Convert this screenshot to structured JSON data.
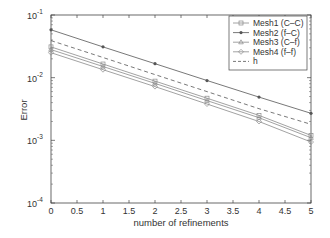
{
  "chart_data": {
    "type": "line",
    "title": "",
    "xlabel": "number of refinements",
    "ylabel": "Error",
    "xscale": "linear",
    "yscale": "log",
    "xlim": [
      0,
      5
    ],
    "ylim": [
      0.0001,
      0.1
    ],
    "grid": false,
    "legend_position": "upper right",
    "x": [
      0,
      1,
      2,
      3,
      4,
      5
    ],
    "x_tick_labels": [
      "0",
      "0.5",
      "1",
      "1.5",
      "2",
      "2.5",
      "3",
      "3.5",
      "4",
      "4.5",
      "5"
    ],
    "x_ticks": [
      0,
      0.5,
      1,
      1.5,
      2,
      2.5,
      3,
      3.5,
      4,
      4.5,
      5
    ],
    "y_ticks": [
      0.1,
      0.01,
      0.001,
      0.0001
    ],
    "y_tick_labels": [
      {
        "base": "10",
        "exp": "-1"
      },
      {
        "base": "10",
        "exp": "-2"
      },
      {
        "base": "10",
        "exp": "-3"
      },
      {
        "base": "10",
        "exp": "-4"
      }
    ],
    "series": [
      {
        "name": "Mesh1 (C–C)",
        "marker": "square",
        "dash": "solid",
        "color": "#8a8a8a",
        "values": [
          0.031,
          0.0165,
          0.0088,
          0.0047,
          0.0025,
          0.0012
        ]
      },
      {
        "name": "Mesh2 (f–C)",
        "marker": "dot",
        "dash": "solid",
        "color": "#555555",
        "values": [
          0.058,
          0.031,
          0.0167,
          0.009,
          0.0049,
          0.0027
        ]
      },
      {
        "name": "Mesh3 (C–f)",
        "marker": "triangle",
        "dash": "solid",
        "color": "#8a8a8a",
        "values": [
          0.028,
          0.0151,
          0.0081,
          0.0043,
          0.0023,
          0.0011
        ]
      },
      {
        "name": "Mesh4 (f–f)",
        "marker": "diamond",
        "dash": "solid",
        "color": "#8a8a8a",
        "values": [
          0.025,
          0.0134,
          0.0072,
          0.0038,
          0.002,
          0.00094
        ]
      },
      {
        "name": "h",
        "marker": "none",
        "dash": "dashed",
        "color": "#555555",
        "values": [
          0.039,
          0.021,
          0.0112,
          0.006,
          0.0032,
          0.0018
        ]
      }
    ]
  }
}
